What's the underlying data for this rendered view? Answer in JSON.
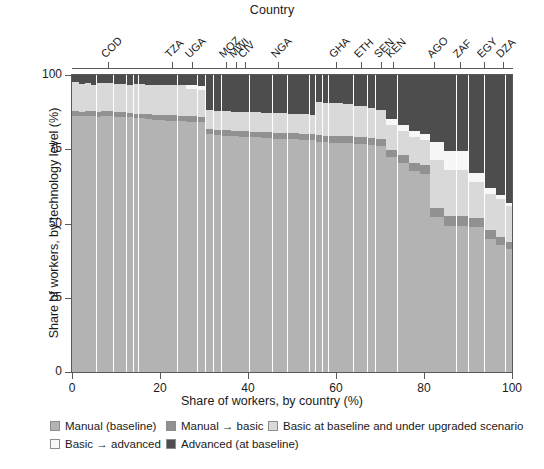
{
  "chart_data": {
    "type": "bar",
    "subtype": "marimekko-stacked-100",
    "title": "Country",
    "xlabel": "Share of workers, by country (%)",
    "ylabel": "Share of workers, by technology level (%)",
    "xlim": [
      0,
      100
    ],
    "ylim": [
      0,
      100
    ],
    "xticks": [
      0,
      20,
      40,
      60,
      80,
      100
    ],
    "yticks": [
      0,
      25,
      50,
      75,
      100
    ],
    "grid": false,
    "legend_position": "bottom-left",
    "series": [
      {
        "name": "Manual (baseline)",
        "color": "#b3b3b3"
      },
      {
        "name": "Manual → basic",
        "color": "#919191"
      },
      {
        "name": "Basic at baseline and under upgraded scenario",
        "color": "#d9d9d9"
      },
      {
        "name": "Basic → advanced",
        "color": "#f7f7f7"
      },
      {
        "name": "Advanced (at baseline)",
        "color": "#4d4d4d"
      }
    ],
    "labeled_countries": [
      {
        "code": "COD",
        "x": 8.1
      },
      {
        "code": "TZA",
        "x": 22.8
      },
      {
        "code": "UGA",
        "x": 27.3
      },
      {
        "code": "MOZ",
        "x": 35.0
      },
      {
        "code": "MWI",
        "x": 37.3
      },
      {
        "code": "CIV",
        "x": 39.2
      },
      {
        "code": "NGA",
        "x": 46.8
      },
      {
        "code": "GHA",
        "x": 59.9
      },
      {
        "code": "ETH",
        "x": 65.6
      },
      {
        "code": "SEN",
        "x": 70.2
      },
      {
        "code": "KEN",
        "x": 73.0
      },
      {
        "code": "AGO",
        "x": 82.2
      },
      {
        "code": "ZAF",
        "x": 88.2
      },
      {
        "code": "EGY",
        "x": 93.6
      },
      {
        "code": "DZA",
        "x": 98.0
      }
    ],
    "columns": [
      {
        "x0": 0.0,
        "x1": 1.6,
        "manual_baseline": 86.5,
        "manual_to_basic": 1.6,
        "basic_both": 9.9,
        "basic_to_advanced": 0.0,
        "advanced": 2.0
      },
      {
        "x0": 1.6,
        "x1": 3.0,
        "manual_baseline": 86.3,
        "manual_to_basic": 1.5,
        "basic_both": 9.4,
        "basic_to_advanced": 0.0,
        "advanced": 2.8
      },
      {
        "x0": 3.0,
        "x1": 4.4,
        "manual_baseline": 86.5,
        "manual_to_basic": 1.5,
        "basic_both": 9.5,
        "basic_to_advanced": 0.0,
        "advanced": 2.5
      },
      {
        "x0": 4.4,
        "x1": 5.6,
        "manual_baseline": 86.4,
        "manual_to_basic": 1.6,
        "basic_both": 9.0,
        "basic_to_advanced": 0.0,
        "advanced": 3.0
      },
      {
        "x0": 5.6,
        "x1": 6.7,
        "manual_baseline": 86.2,
        "manual_to_basic": 1.5,
        "basic_both": 9.8,
        "basic_to_advanced": 0.0,
        "advanced": 2.5
      },
      {
        "x0": 6.7,
        "x1": 9.5,
        "manual_baseline": 86.4,
        "manual_to_basic": 1.6,
        "basic_both": 9.5,
        "basic_to_advanced": 0.0,
        "advanced": 2.5
      },
      {
        "x0": 9.5,
        "x1": 11.0,
        "manual_baseline": 86.0,
        "manual_to_basic": 1.6,
        "basic_both": 9.7,
        "basic_to_advanced": 0.0,
        "advanced": 2.7
      },
      {
        "x0": 11.0,
        "x1": 12.4,
        "manual_baseline": 86.2,
        "manual_to_basic": 1.5,
        "basic_both": 9.6,
        "basic_to_advanced": 0.0,
        "advanced": 2.7
      },
      {
        "x0": 12.4,
        "x1": 14.0,
        "manual_baseline": 86.0,
        "manual_to_basic": 1.5,
        "basic_both": 9.5,
        "basic_to_advanced": 0.0,
        "advanced": 3.0
      },
      {
        "x0": 14.0,
        "x1": 15.2,
        "manual_baseline": 85.8,
        "manual_to_basic": 1.4,
        "basic_both": 10.0,
        "basic_to_advanced": 0.0,
        "advanced": 2.8
      },
      {
        "x0": 15.2,
        "x1": 16.7,
        "manual_baseline": 85.7,
        "manual_to_basic": 1.5,
        "basic_both": 10.0,
        "basic_to_advanced": 0.0,
        "advanced": 2.8
      },
      {
        "x0": 16.7,
        "x1": 18.2,
        "manual_baseline": 85.5,
        "manual_to_basic": 1.5,
        "basic_both": 9.8,
        "basic_to_advanced": 0.0,
        "advanced": 3.2
      },
      {
        "x0": 18.2,
        "x1": 19.6,
        "manual_baseline": 85.2,
        "manual_to_basic": 1.6,
        "basic_both": 10.0,
        "basic_to_advanced": 0.0,
        "advanced": 3.2
      },
      {
        "x0": 19.6,
        "x1": 21.2,
        "manual_baseline": 85.0,
        "manual_to_basic": 1.6,
        "basic_both": 10.2,
        "basic_to_advanced": 0.0,
        "advanced": 3.2
      },
      {
        "x0": 21.2,
        "x1": 24.0,
        "manual_baseline": 84.8,
        "manual_to_basic": 1.8,
        "basic_both": 10.2,
        "basic_to_advanced": 0.0,
        "advanced": 3.2
      },
      {
        "x0": 24.0,
        "x1": 26.0,
        "manual_baseline": 84.6,
        "manual_to_basic": 1.8,
        "basic_both": 10.4,
        "basic_to_advanced": 0.0,
        "advanced": 3.2
      },
      {
        "x0": 26.0,
        "x1": 28.6,
        "manual_baseline": 84.5,
        "manual_to_basic": 1.8,
        "basic_both": 9.2,
        "basic_to_advanced": 1.3,
        "advanced": 3.2
      },
      {
        "x0": 28.6,
        "x1": 30.4,
        "manual_baseline": 84.3,
        "manual_to_basic": 1.8,
        "basic_both": 8.9,
        "basic_to_advanced": 1.5,
        "advanced": 3.5
      },
      {
        "x0": 30.4,
        "x1": 32.2,
        "manual_baseline": 80.2,
        "manual_to_basic": 1.8,
        "basic_both": 6.5,
        "basic_to_advanced": 0.0,
        "advanced": 11.5
      },
      {
        "x0": 32.2,
        "x1": 34.0,
        "manual_baseline": 80.0,
        "manual_to_basic": 1.8,
        "basic_both": 6.4,
        "basic_to_advanced": 0.0,
        "advanced": 11.8
      },
      {
        "x0": 34.0,
        "x1": 36.2,
        "manual_baseline": 79.8,
        "manual_to_basic": 1.8,
        "basic_both": 6.5,
        "basic_to_advanced": 0.0,
        "advanced": 11.9
      },
      {
        "x0": 36.2,
        "x1": 38.0,
        "manual_baseline": 79.6,
        "manual_to_basic": 1.8,
        "basic_both": 6.4,
        "basic_to_advanced": 0.0,
        "advanced": 12.2
      },
      {
        "x0": 38.0,
        "x1": 40.4,
        "manual_baseline": 79.4,
        "manual_to_basic": 1.9,
        "basic_both": 6.5,
        "basic_to_advanced": 0.0,
        "advanced": 12.2
      },
      {
        "x0": 40.4,
        "x1": 43.0,
        "manual_baseline": 79.2,
        "manual_to_basic": 1.9,
        "basic_both": 6.6,
        "basic_to_advanced": 0.0,
        "advanced": 12.3
      },
      {
        "x0": 43.0,
        "x1": 45.6,
        "manual_baseline": 79.0,
        "manual_to_basic": 2.0,
        "basic_both": 6.5,
        "basic_to_advanced": 0.0,
        "advanced": 12.5
      },
      {
        "x0": 45.6,
        "x1": 49.0,
        "manual_baseline": 78.8,
        "manual_to_basic": 2.0,
        "basic_both": 6.6,
        "basic_to_advanced": 0.0,
        "advanced": 12.6
      },
      {
        "x0": 49.0,
        "x1": 51.6,
        "manual_baseline": 78.6,
        "manual_to_basic": 2.0,
        "basic_both": 6.6,
        "basic_to_advanced": 0.0,
        "advanced": 12.8
      },
      {
        "x0": 51.6,
        "x1": 54.0,
        "manual_baseline": 78.4,
        "manual_to_basic": 2.1,
        "basic_both": 6.5,
        "basic_to_advanced": 0.0,
        "advanced": 13.0
      },
      {
        "x0": 54.0,
        "x1": 55.4,
        "manual_baseline": 78.2,
        "manual_to_basic": 2.1,
        "basic_both": 6.5,
        "basic_to_advanced": 0.0,
        "advanced": 13.2
      },
      {
        "x0": 55.4,
        "x1": 57.0,
        "manual_baseline": 77.8,
        "manual_to_basic": 2.2,
        "basic_both": 11.0,
        "basic_to_advanced": 0.0,
        "advanced": 9.0
      },
      {
        "x0": 57.0,
        "x1": 58.4,
        "manual_baseline": 77.6,
        "manual_to_basic": 2.2,
        "basic_both": 11.0,
        "basic_to_advanced": 0.0,
        "advanced": 9.2
      },
      {
        "x0": 58.4,
        "x1": 61.6,
        "manual_baseline": 77.4,
        "manual_to_basic": 2.3,
        "basic_both": 11.1,
        "basic_to_advanced": 0.0,
        "advanced": 9.2
      },
      {
        "x0": 61.6,
        "x1": 64.0,
        "manual_baseline": 77.2,
        "manual_to_basic": 2.3,
        "basic_both": 11.0,
        "basic_to_advanced": 0.0,
        "advanced": 9.5
      },
      {
        "x0": 64.0,
        "x1": 67.2,
        "manual_baseline": 77.0,
        "manual_to_basic": 2.4,
        "basic_both": 10.2,
        "basic_to_advanced": 0.0,
        "advanced": 10.4
      },
      {
        "x0": 67.2,
        "x1": 69.0,
        "manual_baseline": 76.6,
        "manual_to_basic": 2.4,
        "basic_both": 10.0,
        "basic_to_advanced": 0.0,
        "advanced": 11.0
      },
      {
        "x0": 69.0,
        "x1": 71.4,
        "manual_baseline": 76.2,
        "manual_to_basic": 2.5,
        "basic_both": 9.8,
        "basic_to_advanced": 0.0,
        "advanced": 11.5
      },
      {
        "x0": 71.4,
        "x1": 74.0,
        "manual_baseline": 72.5,
        "manual_to_basic": 2.6,
        "basic_both": 8.4,
        "basic_to_advanced": 2.0,
        "advanced": 14.5
      },
      {
        "x0": 74.0,
        "x1": 76.6,
        "manual_baseline": 70.5,
        "manual_to_basic": 2.6,
        "basic_both": 8.4,
        "basic_to_advanced": 2.0,
        "advanced": 16.5
      },
      {
        "x0": 76.6,
        "x1": 79.2,
        "manual_baseline": 68.0,
        "manual_to_basic": 2.7,
        "basic_both": 8.6,
        "basic_to_advanced": 2.2,
        "advanced": 18.5
      },
      {
        "x0": 79.2,
        "x1": 81.4,
        "manual_baseline": 67.0,
        "manual_to_basic": 2.8,
        "basic_both": 8.4,
        "basic_to_advanced": 2.0,
        "advanced": 19.8
      },
      {
        "x0": 81.4,
        "x1": 84.6,
        "manual_baseline": 52.5,
        "manual_to_basic": 3.0,
        "basic_both": 16.0,
        "basic_to_advanced": 6.0,
        "advanced": 22.5
      },
      {
        "x0": 84.6,
        "x1": 87.4,
        "manual_baseline": 49.5,
        "manual_to_basic": 3.2,
        "basic_both": 15.5,
        "basic_to_advanced": 6.3,
        "advanced": 25.5
      },
      {
        "x0": 87.4,
        "x1": 90.2,
        "manual_baseline": 49.5,
        "manual_to_basic": 3.2,
        "basic_both": 15.5,
        "basic_to_advanced": 6.3,
        "advanced": 25.5
      },
      {
        "x0": 90.2,
        "x1": 93.8,
        "manual_baseline": 49.0,
        "manual_to_basic": 3.2,
        "basic_both": 12.0,
        "basic_to_advanced": 3.0,
        "advanced": 32.8
      },
      {
        "x0": 93.8,
        "x1": 96.4,
        "manual_baseline": 45.0,
        "manual_to_basic": 3.0,
        "basic_both": 12.0,
        "basic_to_advanced": 2.0,
        "advanced": 38.0
      },
      {
        "x0": 96.4,
        "x1": 98.6,
        "manual_baseline": 43.0,
        "manual_to_basic": 2.8,
        "basic_both": 12.5,
        "basic_to_advanced": 1.5,
        "advanced": 40.2
      },
      {
        "x0": 98.6,
        "x1": 100.0,
        "manual_baseline": 41.5,
        "manual_to_basic": 2.5,
        "basic_both": 12.0,
        "basic_to_advanced": 1.0,
        "advanced": 43.0
      }
    ]
  },
  "legend": {
    "rows": [
      [
        {
          "label": "Manual (baseline)",
          "color": "#b3b3b3",
          "left": 50
        },
        {
          "label": "Manual → basic",
          "color": "#919191",
          "left": 166
        },
        {
          "label": "Basic at baseline and under upgraded scenario",
          "color": "#d9d9d9",
          "left": 268
        }
      ],
      [
        {
          "label": "Basic → advanced",
          "color": "#f7f7f7",
          "left": 50
        },
        {
          "label": "Advanced (at baseline)",
          "color": "#4d4d4d",
          "left": 166
        }
      ]
    ]
  }
}
